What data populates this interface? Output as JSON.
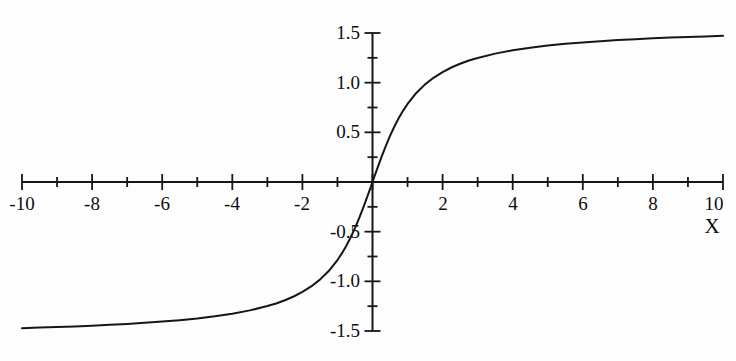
{
  "figure": {
    "background_color": "#fdfdfd",
    "ink_color": "#161616",
    "width": 736,
    "height": 361
  },
  "axes": {
    "x_axis_title": "X",
    "y_axis_title": "",
    "x_tick_labels": [
      "-10",
      "-8",
      "-6",
      "-4",
      "-2",
      "2",
      "4",
      "6",
      "8",
      "10"
    ],
    "y_tick_labels": [
      "1.5",
      "1.0",
      "0.5",
      "-0.5",
      "-1.0",
      "-1.5"
    ]
  },
  "chart_data": {
    "type": "line",
    "title": "",
    "subtitle": "",
    "xlabel": "X",
    "ylabel": "",
    "grid": false,
    "legend": null,
    "axis_style": "crossed-at-origin",
    "xlim": [
      -10,
      10
    ],
    "ylim": [
      -1.5,
      1.5
    ],
    "x_major_ticks": [
      -10,
      -8,
      -6,
      -4,
      -2,
      0,
      2,
      4,
      6,
      8,
      10
    ],
    "x_minor_ticks": [
      -9,
      -7,
      -5,
      -3,
      -1,
      1,
      3,
      5,
      7,
      9
    ],
    "x_tick_labels": [
      "-10",
      "-8",
      "-6",
      "-4",
      "-2",
      "",
      "2",
      "4",
      "6",
      "8",
      "10"
    ],
    "y_major_ticks": [
      -1.5,
      -1.0,
      -0.5,
      0,
      0.5,
      1.0,
      1.5
    ],
    "y_minor_ticks": [
      -1.25,
      -0.75,
      -0.25,
      0.25,
      0.75,
      1.25
    ],
    "y_tick_labels": [
      "-1.5",
      "-1.0",
      "-0.5",
      "",
      "0.5",
      "1.0",
      "1.5"
    ],
    "series": [
      {
        "name": "arctan(x)",
        "function": "y = arctan(x)",
        "color": "#161616",
        "line_width": 2,
        "x": [
          -10,
          -9.5,
          -9,
          -8.5,
          -8,
          -7.5,
          -7,
          -6.5,
          -6,
          -5.5,
          -5,
          -4.5,
          -4,
          -3.5,
          -3,
          -2.75,
          -2.5,
          -2.25,
          -2,
          -1.75,
          -1.5,
          -1.25,
          -1,
          -0.875,
          -0.75,
          -0.625,
          -0.5,
          -0.375,
          -0.25,
          -0.125,
          0,
          0.125,
          0.25,
          0.375,
          0.5,
          0.625,
          0.75,
          0.875,
          1,
          1.25,
          1.5,
          1.75,
          2,
          2.25,
          2.5,
          2.75,
          3,
          3.5,
          4,
          4.5,
          5,
          5.5,
          6,
          6.5,
          7,
          7.5,
          8,
          8.5,
          9,
          9.5,
          10
        ],
        "y": [
          -1.4711,
          -1.4659,
          -1.4601,
          -1.4536,
          -1.4464,
          -1.4382,
          -1.4289,
          -1.4182,
          -1.4056,
          -1.3906,
          -1.3734,
          -1.3521,
          -1.3258,
          -1.2925,
          -1.249,
          -1.2225,
          -1.1903,
          -1.1526,
          -1.1071,
          -1.0517,
          -0.9828,
          -0.8961,
          -0.7854,
          -0.7188,
          -0.6435,
          -0.5586,
          -0.4636,
          -0.3588,
          -0.245,
          -0.1244,
          0,
          0.1244,
          0.245,
          0.3588,
          0.4636,
          0.5586,
          0.6435,
          0.7188,
          0.7854,
          0.8961,
          0.9828,
          1.0517,
          1.1071,
          1.1526,
          1.1903,
          1.2225,
          1.249,
          1.2925,
          1.3258,
          1.3521,
          1.3734,
          1.3906,
          1.4056,
          1.4182,
          1.4289,
          1.4382,
          1.4464,
          1.4536,
          1.4601,
          1.4659,
          1.4711
        ]
      }
    ],
    "annotations": []
  }
}
